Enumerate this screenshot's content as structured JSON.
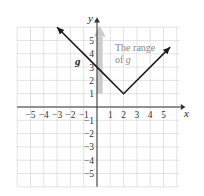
{
  "chart_data": {
    "type": "line",
    "title": "",
    "xlabel": "x",
    "ylabel": "y",
    "xlim": [
      -6,
      6
    ],
    "ylim": [
      -6,
      6
    ],
    "grid": true,
    "x_ticks": [
      -5,
      -4,
      -3,
      -2,
      -1,
      1,
      2,
      3,
      4,
      5
    ],
    "y_ticks": [
      5,
      4,
      3,
      2,
      1,
      -1,
      -2,
      -3,
      -4,
      -5
    ],
    "x_tick_labels": [
      "−5",
      "−4",
      "−3",
      "−2",
      "−1",
      "1",
      "2",
      "3",
      "4",
      "5"
    ],
    "y_tick_labels": [
      "5",
      "4",
      "3",
      "2",
      "1",
      "−1",
      "−2",
      "−3",
      "−4",
      "−5"
    ],
    "series": [
      {
        "name": "g",
        "function": "g(x) = |x − 2| + 1",
        "x": [
          -3,
          0,
          2,
          5.5
        ],
        "y": [
          6,
          3,
          1,
          4.5
        ],
        "vertex": [
          2,
          1
        ],
        "y_intercept": 3,
        "color": "#1a1a1a",
        "arrows_both_ends": true
      }
    ],
    "annotations": [
      {
        "text_line1": "The range",
        "text_line2": "of ",
        "text_italic": "g",
        "color": "#888888"
      },
      {
        "text": "g",
        "position": [
          -1.5,
          3.5
        ],
        "bold_italic": true
      }
    ],
    "range_arrow": {
      "from_y": 1,
      "to_y": 6,
      "x": 0.2,
      "color": "#c8c8c8"
    }
  },
  "labels": {
    "x_axis": "x",
    "y_axis": "y",
    "function_label": "g",
    "range_line1": "The range",
    "range_line2_prefix": "of ",
    "range_line2_var": "g"
  },
  "colors": {
    "grid": "#d0d0d0",
    "axis": "#333333",
    "curve": "#1a1a1a",
    "range_band": "#cccccc",
    "annotation": "#888888"
  }
}
